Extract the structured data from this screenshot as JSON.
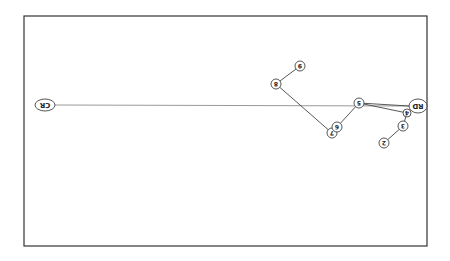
{
  "diagram": {
    "type": "network-tree",
    "orientation_note": "labels rendered upside down (rotated 180deg)",
    "frame": {
      "x": 24,
      "y": 16,
      "width": 403,
      "height": 230,
      "stroke": "#333333"
    },
    "colors": {
      "edge": "#444444",
      "long_edge": "#9a9a9a",
      "node_stroke": "#444444",
      "node_fill": "#ffffff",
      "label": "#222222"
    },
    "nodes": [
      {
        "id": "CR",
        "label": "CR",
        "x": 45,
        "y": 105,
        "rx": 10,
        "ry": 6
      },
      {
        "id": "RD",
        "label": "RD",
        "x": 418,
        "y": 106,
        "rx": 9,
        "ry": 7
      },
      {
        "id": "n9",
        "label": "9",
        "x": 300,
        "y": 66,
        "rx": 5,
        "ry": 5
      },
      {
        "id": "n8",
        "label": "8",
        "x": 276,
        "y": 84,
        "rx": 5,
        "ry": 5
      },
      {
        "id": "n7",
        "label": "7",
        "x": 332,
        "y": 133,
        "rx": 5,
        "ry": 5
      },
      {
        "id": "n6",
        "label": "6",
        "x": 337,
        "y": 127,
        "rx": 5,
        "ry": 5
      },
      {
        "id": "n5",
        "label": "5",
        "x": 359,
        "y": 103,
        "rx": 5,
        "ry": 5
      },
      {
        "id": "n4",
        "label": "4",
        "x": 407,
        "y": 113,
        "rx": 4,
        "ry": 4
      },
      {
        "id": "n3",
        "label": "3",
        "x": 403,
        "y": 126,
        "rx": 5,
        "ry": 5
      },
      {
        "id": "n2",
        "label": "2",
        "x": 384,
        "y": 143,
        "rx": 5,
        "ry": 5
      }
    ],
    "edges": [
      {
        "from": "CR",
        "to": "RD",
        "x1": 55,
        "y1": 105,
        "x2": 409,
        "y2": 106,
        "style": "long"
      },
      {
        "from": "n9",
        "to": "n8",
        "x1": 300,
        "y1": 66,
        "x2": 276,
        "y2": 84,
        "style": "normal"
      },
      {
        "from": "n8",
        "to": "n7",
        "x1": 276,
        "y1": 84,
        "x2": 332,
        "y2": 133,
        "style": "normal"
      },
      {
        "from": "n6",
        "to": "n5",
        "x1": 337,
        "y1": 127,
        "x2": 359,
        "y2": 103,
        "style": "normal"
      },
      {
        "from": "n5",
        "to": "n4",
        "x1": 359,
        "y1": 103,
        "x2": 407,
        "y2": 113,
        "style": "normal"
      },
      {
        "from": "n5",
        "to": "RD",
        "x1": 359,
        "y1": 103,
        "x2": 409,
        "y2": 106,
        "style": "normal"
      },
      {
        "from": "n4",
        "to": "n3",
        "x1": 407,
        "y1": 113,
        "x2": 403,
        "y2": 126,
        "style": "normal"
      },
      {
        "from": "n3",
        "to": "n2",
        "x1": 403,
        "y1": 126,
        "x2": 384,
        "y2": 143,
        "style": "normal"
      }
    ]
  }
}
